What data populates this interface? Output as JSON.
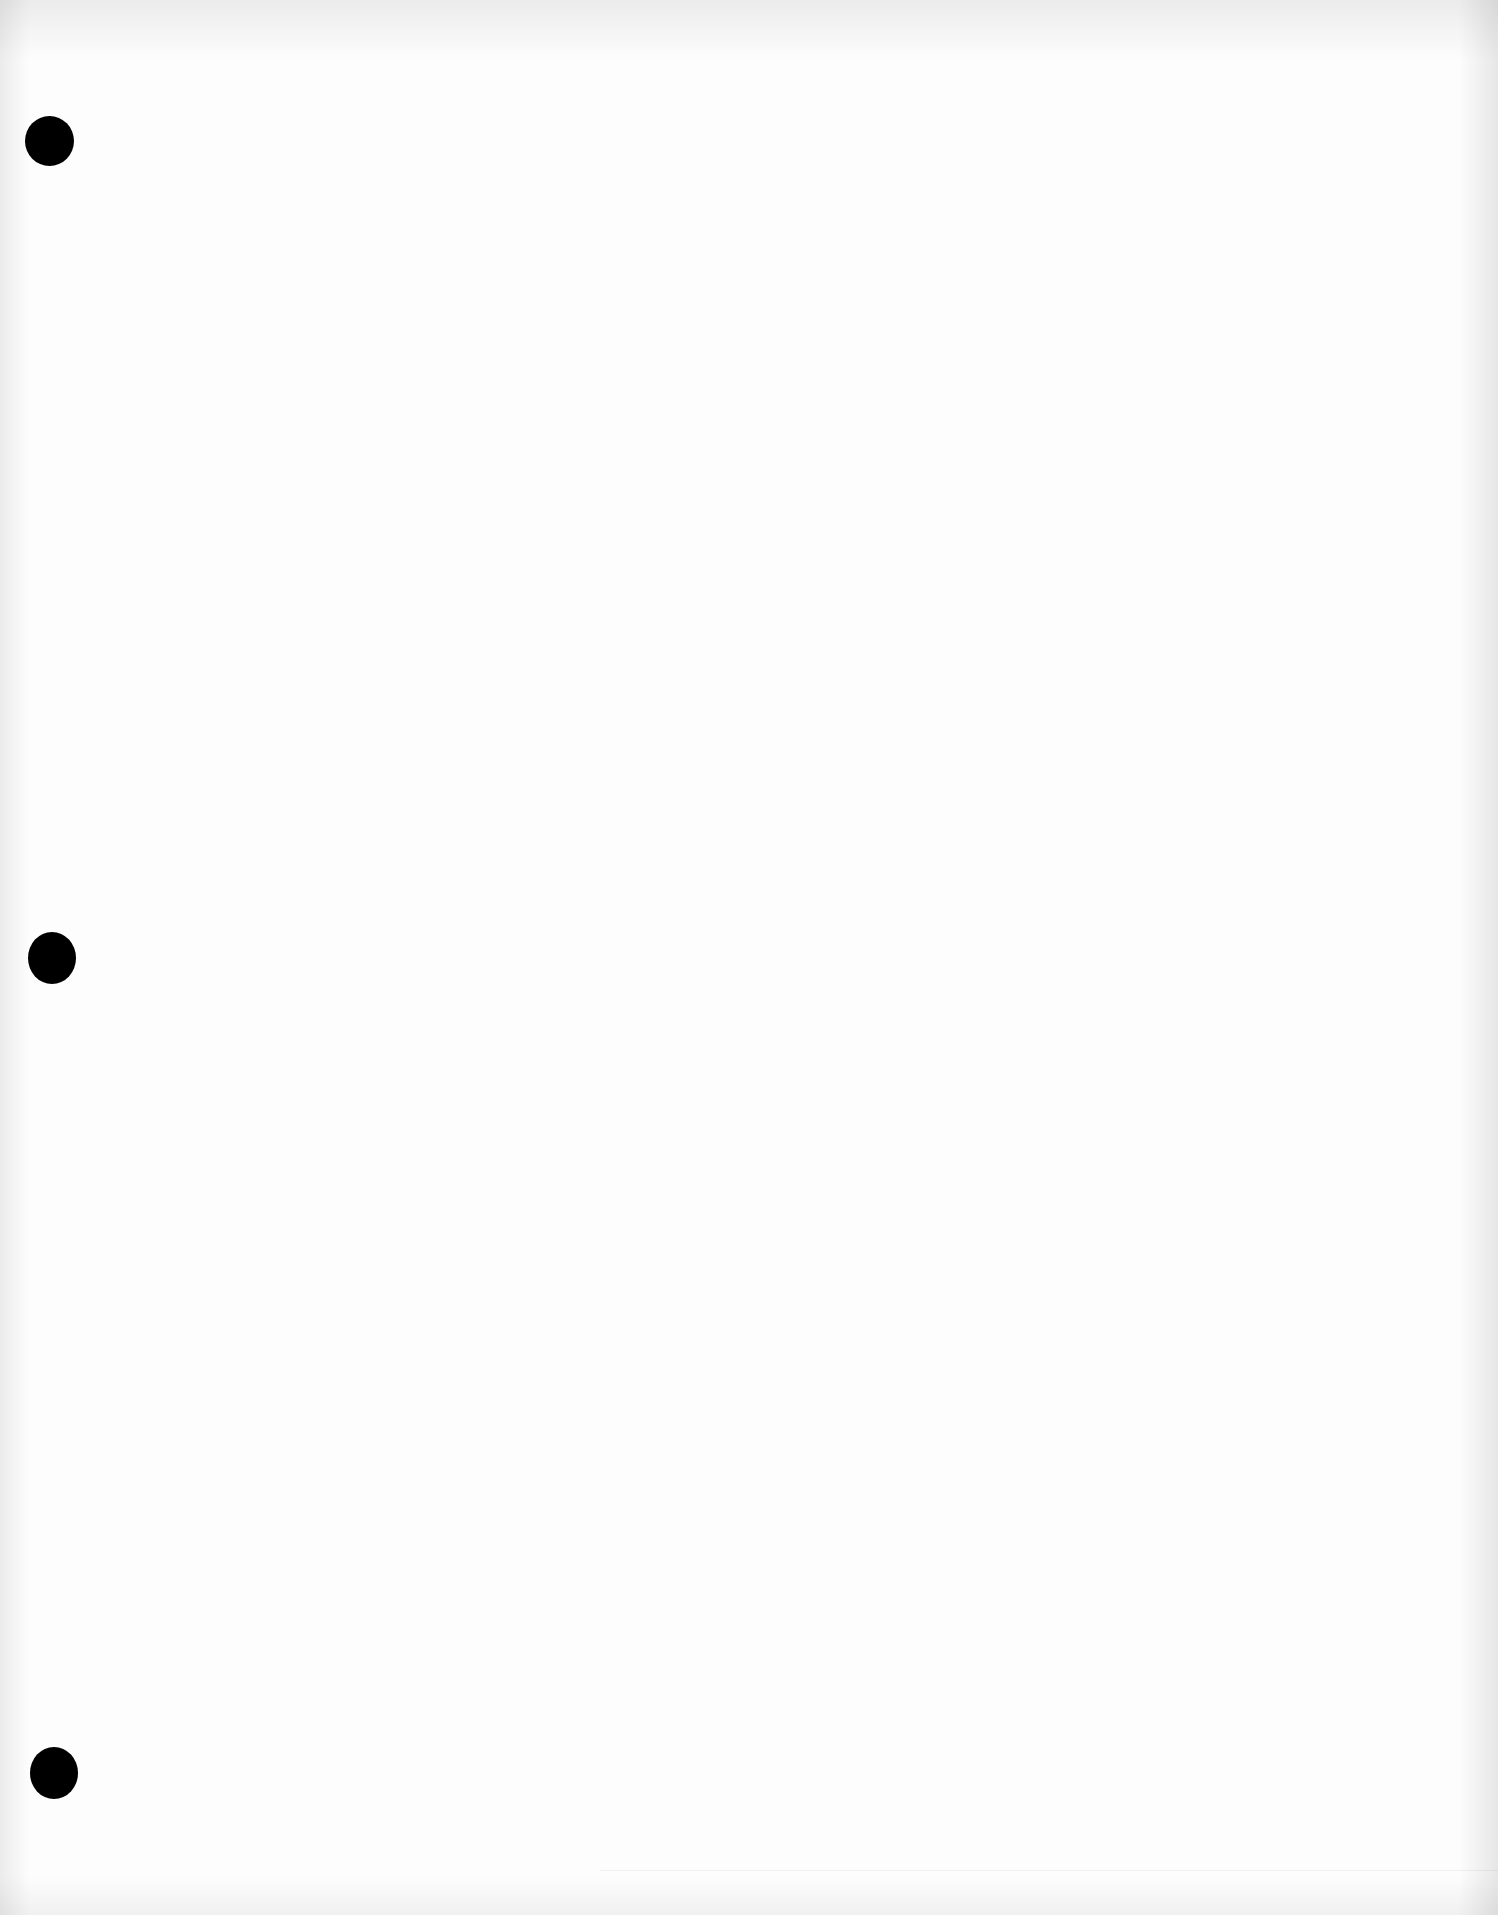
{
  "page": {
    "type": "blank scanned sheet",
    "background_color": "#fdfdfd",
    "punch_holes": [
      {
        "position": "top-left",
        "color": "#000000"
      },
      {
        "position": "middle-left",
        "color": "#000000"
      },
      {
        "position": "bottom-left",
        "color": "#000000"
      }
    ],
    "text": ""
  }
}
